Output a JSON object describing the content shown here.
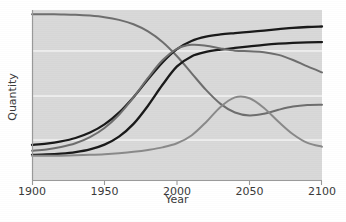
{
  "figure": {
    "background_color": "#ffffff",
    "plot_background_color": "#d9d9d9",
    "gridline_color": "#f3f3f3"
  },
  "chart_data": {
    "type": "line",
    "title": "",
    "xlabel": "Year",
    "ylabel": "Quantity",
    "xlim": [
      1900,
      2100
    ],
    "ylim": [
      0,
      1
    ],
    "xticks": [
      1900,
      1950,
      2000,
      2050,
      2100
    ],
    "xticklabels": [
      "1900",
      "1950",
      "2000",
      "2050",
      "2100"
    ],
    "yticks": [],
    "yticklabels": [],
    "grid": "horizontal",
    "gridline_values": [
      0.8,
      0.55,
      0.3
    ],
    "legend": "none",
    "x": [
      1900,
      1910,
      1920,
      1930,
      1940,
      1950,
      1960,
      1970,
      1980,
      1990,
      2000,
      2010,
      2020,
      2030,
      2040,
      2050,
      2060,
      2070,
      2080,
      2090,
      2100
    ],
    "series": [
      {
        "name": "declining-from-top",
        "color": "#6e6e6e",
        "width": 2.0,
        "values": [
          0.975,
          0.975,
          0.974,
          0.972,
          0.967,
          0.958,
          0.942,
          0.916,
          0.874,
          0.812,
          0.728,
          0.629,
          0.53,
          0.448,
          0.397,
          0.38,
          0.39,
          0.413,
          0.432,
          0.441,
          0.443
        ]
      },
      {
        "name": "black-upper-sigmoid",
        "color": "#1a1a1a",
        "width": 2.3,
        "values": [
          0.206,
          0.214,
          0.227,
          0.247,
          0.279,
          0.327,
          0.396,
          0.487,
          0.592,
          0.692,
          0.77,
          0.818,
          0.843,
          0.856,
          0.864,
          0.871,
          0.879,
          0.887,
          0.895,
          0.9,
          0.903
        ]
      },
      {
        "name": "black-lower-sigmoid",
        "color": "#1a1a1a",
        "width": 2.3,
        "values": [
          0.148,
          0.15,
          0.155,
          0.164,
          0.18,
          0.208,
          0.255,
          0.33,
          0.437,
          0.56,
          0.668,
          0.727,
          0.753,
          0.767,
          0.777,
          0.786,
          0.795,
          0.802,
          0.807,
          0.81,
          0.811
        ]
      },
      {
        "name": "gray-sigmoid-then-fall",
        "color": "#6e6e6e",
        "width": 2.0,
        "values": [
          0.172,
          0.18,
          0.194,
          0.216,
          0.252,
          0.306,
          0.384,
          0.486,
          0.601,
          0.704,
          0.772,
          0.795,
          0.79,
          0.774,
          0.761,
          0.757,
          0.752,
          0.736,
          0.706,
          0.668,
          0.633
        ]
      },
      {
        "name": "gray-low-bump",
        "color": "#8a8a8a",
        "width": 2.0,
        "values": [
          0.142,
          0.142,
          0.143,
          0.145,
          0.148,
          0.152,
          0.158,
          0.166,
          0.177,
          0.192,
          0.216,
          0.262,
          0.34,
          0.43,
          0.486,
          0.481,
          0.424,
          0.343,
          0.269,
          0.218,
          0.196
        ]
      }
    ]
  }
}
